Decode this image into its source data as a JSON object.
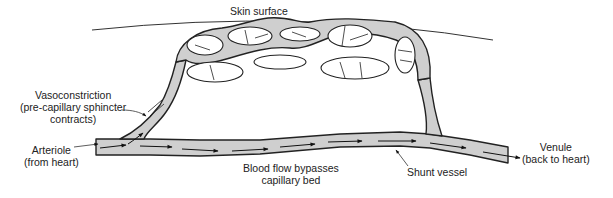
{
  "diagram": {
    "labels": {
      "skin_surface": "Skin surface",
      "vasoconstriction_line1": "Vasoconstriction",
      "vasoconstriction_line2": "(pre-capillary sphincter",
      "vasoconstriction_line3": "contracts)",
      "arteriole_line1": "Arteriole",
      "arteriole_line2": "(from heart)",
      "bypass_line1": "Blood flow bypasses",
      "bypass_line2": "capillary bed",
      "shunt": "Shunt vessel",
      "venule_line1": "Venule",
      "venule_line2": "(back to heart)"
    },
    "colors": {
      "vessel_fill": "#cfcfcf",
      "outline": "#222222",
      "background": "#ffffff"
    }
  }
}
